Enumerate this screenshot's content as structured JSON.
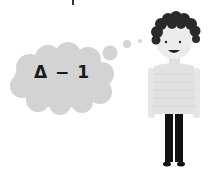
{
  "illustration": {
    "thought_text": "Δ − 1",
    "colors": {
      "cloud": "#d2d2d2",
      "hair": "#2a2a2a",
      "skin": "#ededed",
      "sweater": "#e3e3e3",
      "pants": "#111111",
      "background": "#ffffff"
    }
  }
}
